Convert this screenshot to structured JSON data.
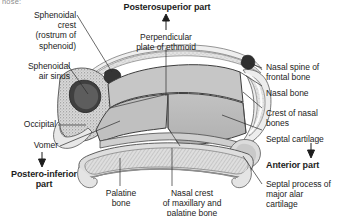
{
  "figure": {
    "title_fragment": "nose:",
    "orientation_labels": [
      {
        "id": "posterosuperior",
        "text": "Posterosuperior part"
      },
      {
        "id": "anterior",
        "text": "Anterior part"
      },
      {
        "id": "postero-inferior",
        "text": "Postero-inferior\npart"
      }
    ],
    "labels": {
      "sphenoidal_crest": "Sphenoidal\ncrest\n(rostrum of\nsphenoid)",
      "sphenoidal_air_sinus": "Sphenoidal\nair sinus",
      "occipital": "Occipital",
      "vomer": "Vomer",
      "perpendicular_plate": "Perpendicular\nplate of ethmoid",
      "nasal_spine_frontal": "Nasal spine of\nfrontal bone",
      "nasal_bone": "Nasal bone",
      "crest_of_nasal_bones": "Crest of nasal\nbones",
      "septal_cartilage": "Septal cartilage",
      "septal_process_alar": "Septal process of\nmajor alar\ncartilage",
      "palatine_bone": "Palatine\nbone",
      "nasal_crest_maxillary": "Nasal crest\nof maxillary and\npalatine bone"
    },
    "colors": {
      "background": "#ffffff",
      "text": "#1d1d1d",
      "leader_line": "#2b2b2b",
      "septal_cartilage_fill": "#b9b9b9",
      "perpendicular_plate_fill": "#c4c4c4",
      "vomer_fill": "#c8c8c8",
      "bone_outline": "#4a4a4a",
      "sinus_dark": "#3a3a3a",
      "palate_fill": "#d2d2d2",
      "mucosa_light": "#e6e6e6"
    }
  }
}
